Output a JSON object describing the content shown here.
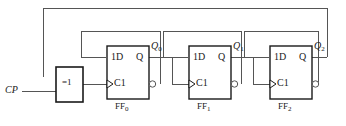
{
  "diagram": {
    "background": "#ffffff",
    "line_color": "#555555",
    "box_border_color": "#1a1a1a",
    "text_color": "#1a1a1a"
  },
  "clock": {
    "label": "CP"
  },
  "xor_gate": {
    "label": "=1",
    "name": "xor-gate"
  },
  "flipflops": [
    {
      "name": "FF",
      "index": "0",
      "data_input": "1D",
      "clock_input": "C1",
      "q_output": "Q",
      "q_label": "Q",
      "q_index": "0"
    },
    {
      "name": "FF",
      "index": "1",
      "data_input": "1D",
      "clock_input": "C1",
      "q_output": "Q",
      "q_label": "Q",
      "q_index": "1"
    },
    {
      "name": "FF",
      "index": "2",
      "data_input": "1D",
      "clock_input": "C1",
      "q_output": "Q",
      "q_label": "Q",
      "q_index": "2"
    }
  ]
}
